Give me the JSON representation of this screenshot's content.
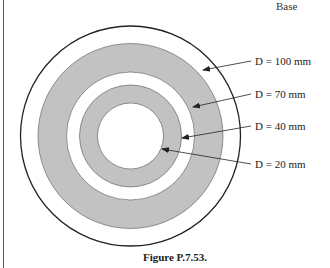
{
  "header": {
    "label": "Base"
  },
  "figure": {
    "caption": "Figure P.7.53.",
    "colors": {
      "ring_fill": "#c2c2c2",
      "stroke": "#222222",
      "background": "#ffffff"
    },
    "circles": [
      {
        "diameter_label": "D = 100 mm",
        "radius_px": 112,
        "fill": "#ffffff"
      },
      {
        "diameter_label": "D = 70 mm",
        "radius_px": 64,
        "fill": "#ffffff"
      },
      {
        "diameter_label": "D = 40 mm",
        "radius_px": 51,
        "fill": "#c2c2c2"
      },
      {
        "diameter_label": "D = 20 mm",
        "radius_px": 33,
        "fill": "#ffffff"
      }
    ],
    "labels": {
      "d100": "D = 100 mm",
      "d70": "D = 70 mm",
      "d40": "D = 40 mm",
      "d20": "D = 20 mm"
    }
  }
}
